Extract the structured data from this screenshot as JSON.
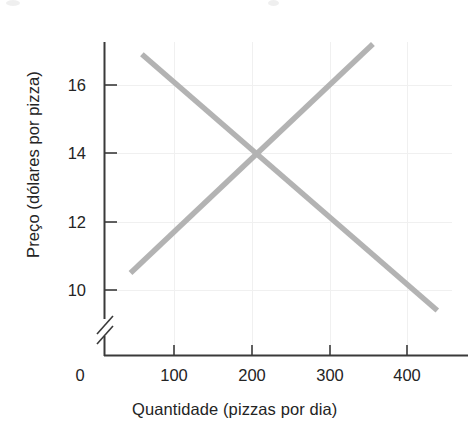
{
  "chart_data": {
    "type": "line",
    "title": "",
    "xlabel": "Quantidade (pizzas por dia)",
    "ylabel": "Preço (dólares por pizza)",
    "xlim": [
      0,
      460
    ],
    "ylim": [
      9,
      17.6
    ],
    "y_axis_break": true,
    "y_axis_break_symbol": "//",
    "grid": "faint",
    "legend": "none",
    "xticks": [
      0,
      100,
      200,
      300,
      400
    ],
    "xtick_labels": [
      "0",
      "100",
      "200",
      "300",
      "400"
    ],
    "yticks": [
      10,
      12,
      14,
      16
    ],
    "ytick_labels": [
      "10",
      "12",
      "14",
      "16"
    ],
    "line_color": "#b3b3b3",
    "axis_color": "#3a3a3a",
    "series": [
      {
        "name": "demand",
        "direction": "downward-sloping",
        "x": [
          50,
          440
        ],
        "y": [
          16.9,
          9.4
        ]
      },
      {
        "name": "supply",
        "direction": "upward-sloping",
        "x": [
          35,
          355
        ],
        "y": [
          10.5,
          17.2
        ]
      }
    ],
    "equilibrium": {
      "x": 200,
      "y": 14
    }
  },
  "axes": {
    "y_title": "Preço (dólares por pizza)",
    "x_title": "Quantidade (pizzas por dia)",
    "y_ticks": [
      {
        "label": "16",
        "value": 16
      },
      {
        "label": "14",
        "value": 14
      },
      {
        "label": "12",
        "value": 12
      },
      {
        "label": "10",
        "value": 10
      }
    ],
    "x_ticks": [
      {
        "label": "0",
        "value": 0
      },
      {
        "label": "100",
        "value": 100
      },
      {
        "label": "200",
        "value": 200
      },
      {
        "label": "300",
        "value": 300
      },
      {
        "label": "400",
        "value": 400
      }
    ]
  }
}
